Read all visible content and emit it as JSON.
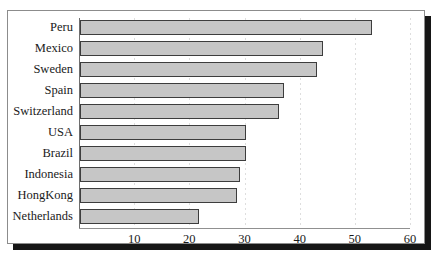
{
  "chart_data": {
    "type": "bar",
    "orientation": "horizontal",
    "title": "",
    "xlabel": "",
    "ylabel": "",
    "categories": [
      "Peru",
      "Mexico",
      "Sweden",
      "Spain",
      "Switzerland",
      "USA",
      "Brazil",
      "Indonesia",
      "HongKong",
      "Netherlands"
    ],
    "values": [
      53,
      44,
      43,
      37,
      36,
      30,
      30,
      29,
      28.5,
      21.5
    ],
    "xlim": [
      0,
      60
    ],
    "ylim": null,
    "xticks": [
      10,
      20,
      30,
      40,
      50,
      60
    ],
    "xtick_labels": [
      "10",
      "20",
      "30",
      "40",
      "50",
      "60"
    ],
    "grid": "vertical-dotted",
    "legend": null,
    "bar_fill_color": "#c6c6c6",
    "bar_border_color": "#3d3d3d"
  },
  "figure": {
    "title_fragment": "",
    "frame_color": "#8c8c8c",
    "shadow_color": "#161616",
    "background": "#ffffff"
  }
}
